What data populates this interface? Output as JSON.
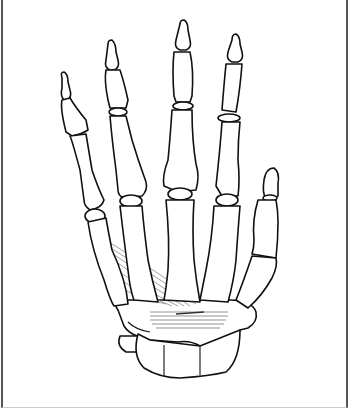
{
  "figure": {
    "colors": {
      "background": "#ffffff",
      "outline": "#111111",
      "muscle": "#888888",
      "frame": "#555555"
    }
  }
}
